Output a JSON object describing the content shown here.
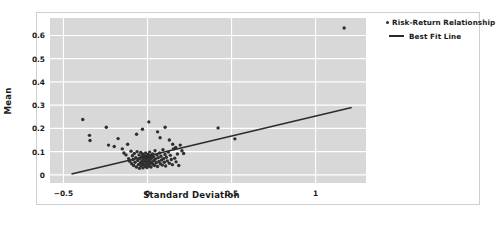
{
  "chart_data": {
    "type": "scatter",
    "title": "",
    "xlabel": "Standard Deviation",
    "ylabel": "Mean",
    "xlim": [
      -0.58,
      1.3
    ],
    "ylim": [
      -0.035,
      0.675
    ],
    "xticks": [
      "−0.5",
      "0",
      "0.5",
      "1"
    ],
    "xtick_values": [
      -0.5,
      0,
      0.5,
      1
    ],
    "yticks": [
      "0",
      "0.1",
      "0.2",
      "0.3",
      "0.4",
      "0.5",
      "0.6"
    ],
    "ytick_values": [
      0,
      0.1,
      0.2,
      0.3,
      0.4,
      0.5,
      0.6
    ],
    "grid": true,
    "grid_color": "#ffffff",
    "panel_color": "#d8d8d8",
    "marker_color": "#2f2f2f",
    "line_color": "#2b2b2b",
    "legend_position": "outside-top-right",
    "series": [
      {
        "name": "Risk-Return Relationship",
        "type": "scatter",
        "points": [
          [
            -0.385,
            0.238
          ],
          [
            -0.345,
            0.17
          ],
          [
            -0.342,
            0.148
          ],
          [
            -0.245,
            0.205
          ],
          [
            -0.232,
            0.128
          ],
          [
            -0.198,
            0.122
          ],
          [
            -0.175,
            0.156
          ],
          [
            -0.15,
            0.112
          ],
          [
            -0.14,
            0.094
          ],
          [
            -0.128,
            0.086
          ],
          [
            -0.118,
            0.132
          ],
          [
            -0.112,
            0.07
          ],
          [
            -0.105,
            0.058
          ],
          [
            -0.098,
            0.102
          ],
          [
            -0.094,
            0.048
          ],
          [
            -0.09,
            0.082
          ],
          [
            -0.086,
            0.066
          ],
          [
            -0.082,
            0.04
          ],
          [
            -0.078,
            0.092
          ],
          [
            -0.074,
            0.054
          ],
          [
            -0.07,
            0.074
          ],
          [
            -0.066,
            0.034
          ],
          [
            -0.062,
            0.1
          ],
          [
            -0.058,
            0.062
          ],
          [
            -0.054,
            0.044
          ],
          [
            -0.05,
            0.086
          ],
          [
            -0.048,
            0.028
          ],
          [
            -0.046,
            0.07
          ],
          [
            -0.042,
            0.052
          ],
          [
            -0.04,
            0.096
          ],
          [
            -0.038,
            0.038
          ],
          [
            -0.035,
            0.078
          ],
          [
            -0.033,
            0.06
          ],
          [
            -0.031,
            0.046
          ],
          [
            -0.029,
            0.09
          ],
          [
            -0.027,
            0.03
          ],
          [
            -0.025,
            0.068
          ],
          [
            -0.023,
            0.054
          ],
          [
            -0.021,
            0.084
          ],
          [
            -0.019,
            0.042
          ],
          [
            -0.017,
            0.074
          ],
          [
            -0.015,
            0.058
          ],
          [
            -0.013,
            0.036
          ],
          [
            -0.011,
            0.094
          ],
          [
            -0.009,
            0.064
          ],
          [
            -0.007,
            0.048
          ],
          [
            -0.005,
            0.08
          ],
          [
            -0.003,
            0.032
          ],
          [
            -0.001,
            0.07
          ],
          [
            0.001,
            0.056
          ],
          [
            0.003,
            0.088
          ],
          [
            0.005,
            0.044
          ],
          [
            0.007,
            0.076
          ],
          [
            0.009,
            0.06
          ],
          [
            0.011,
            0.038
          ],
          [
            0.013,
            0.098
          ],
          [
            0.015,
            0.066
          ],
          [
            0.017,
            0.05
          ],
          [
            0.019,
            0.082
          ],
          [
            0.021,
            0.034
          ],
          [
            0.024,
            0.072
          ],
          [
            0.027,
            0.056
          ],
          [
            0.03,
            0.09
          ],
          [
            0.033,
            0.046
          ],
          [
            0.036,
            0.078
          ],
          [
            0.039,
            0.062
          ],
          [
            0.042,
            0.04
          ],
          [
            0.045,
            0.104
          ],
          [
            0.048,
            0.068
          ],
          [
            0.052,
            0.052
          ],
          [
            0.056,
            0.086
          ],
          [
            0.06,
            0.036
          ],
          [
            0.064,
            0.074
          ],
          [
            0.068,
            0.058
          ],
          [
            0.072,
            0.094
          ],
          [
            0.076,
            0.048
          ],
          [
            0.08,
            0.08
          ],
          [
            0.084,
            0.064
          ],
          [
            0.088,
            0.042
          ],
          [
            0.092,
            0.108
          ],
          [
            0.096,
            0.07
          ],
          [
            0.1,
            0.054
          ],
          [
            0.104,
            0.088
          ],
          [
            0.108,
            0.038
          ],
          [
            0.112,
            0.076
          ],
          [
            0.118,
            0.06
          ],
          [
            0.124,
            0.098
          ],
          [
            0.13,
            0.05
          ],
          [
            0.136,
            0.084
          ],
          [
            0.142,
            0.066
          ],
          [
            0.148,
            0.044
          ],
          [
            0.155,
            0.112
          ],
          [
            0.162,
            0.072
          ],
          [
            0.17,
            0.056
          ],
          [
            0.178,
            0.09
          ],
          [
            0.186,
            0.04
          ],
          [
            0.06,
            0.185
          ],
          [
            0.075,
            0.16
          ],
          [
            0.105,
            0.205
          ],
          [
            0.008,
            0.228
          ],
          [
            -0.03,
            0.196
          ],
          [
            -0.065,
            0.175
          ],
          [
            0.13,
            0.15
          ],
          [
            0.15,
            0.132
          ],
          [
            0.168,
            0.118
          ],
          [
            0.195,
            0.128
          ],
          [
            0.205,
            0.104
          ],
          [
            0.215,
            0.092
          ],
          [
            0.42,
            0.202
          ],
          [
            0.52,
            0.155
          ],
          [
            1.17,
            0.632
          ]
        ]
      },
      {
        "name": "Best Fit Line",
        "type": "line",
        "endpoints": [
          [
            -0.452,
            0.004
          ],
          [
            1.215,
            0.29
          ]
        ],
        "slope": 0.1716,
        "intercept": 0.0816
      }
    ]
  },
  "legend": {
    "items": [
      {
        "label": "Risk-Return Relationship",
        "key": "scatter-marker"
      },
      {
        "label": "Best Fit Line",
        "key": "line-marker"
      }
    ]
  }
}
